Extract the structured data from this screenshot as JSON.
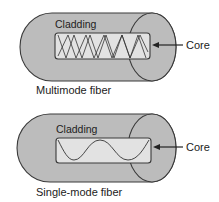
{
  "diagrams": [
    {
      "title": "Multimode fiber",
      "outer_label": "Cladding",
      "inner_label": "Core",
      "wave": "multiple zigzag paths"
    },
    {
      "title": "Single-mode fiber",
      "outer_label": "Cladding",
      "inner_label": "Core",
      "wave": "single sinusoidal path"
    }
  ],
  "colors": {
    "cladding_fill": "#bcbcbc",
    "core_fill": "#e2e2e2",
    "outline": "#3a3a3a",
    "background": "#ffffff"
  }
}
